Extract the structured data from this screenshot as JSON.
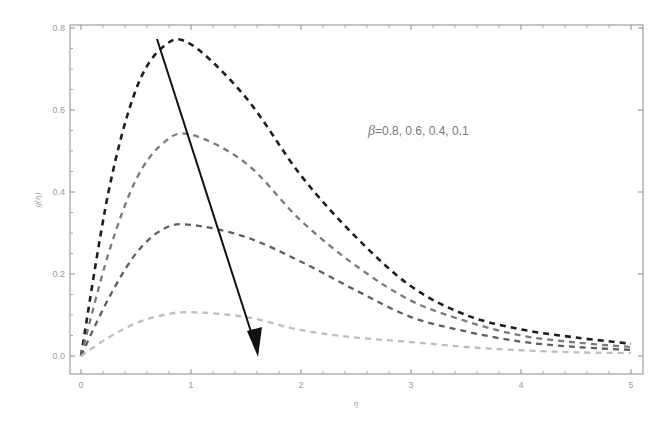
{
  "chart_data": {
    "type": "line",
    "title": "",
    "xlabel": "η",
    "ylabel": "g(η)",
    "xlim": [
      0,
      5
    ],
    "ylim": [
      0.0,
      0.8
    ],
    "xticks": [
      0,
      1,
      2,
      3,
      4,
      5
    ],
    "xtick_labels": [
      "0",
      "1",
      "2",
      "3",
      "4",
      "5"
    ],
    "yticks": [
      0.0,
      0.2,
      0.4,
      0.6,
      0.8
    ],
    "ytick_labels": [
      "0.0",
      "0.2",
      "0.4",
      "0.6",
      "0.8"
    ],
    "grid": false,
    "legend": null,
    "x": [
      0,
      0.25,
      0.5,
      0.75,
      1.0,
      1.5,
      2.0,
      2.5,
      3.0,
      3.5,
      4.0,
      4.5,
      5.0
    ],
    "series": [
      {
        "name": "β=0.8",
        "color": "#1e1e1e",
        "dash": "dashed",
        "values": [
          0,
          0.4,
          0.65,
          0.755,
          0.76,
          0.63,
          0.44,
          0.29,
          0.17,
          0.1,
          0.065,
          0.045,
          0.03
        ]
      },
      {
        "name": "β=0.6",
        "color": "#7a7a7a",
        "dash": "dashed",
        "values": [
          0,
          0.25,
          0.43,
          0.52,
          0.54,
          0.47,
          0.33,
          0.22,
          0.135,
          0.085,
          0.05,
          0.033,
          0.022
        ]
      },
      {
        "name": "β=0.4",
        "color": "#5e5e5e",
        "dash": "dashed",
        "values": [
          0,
          0.14,
          0.25,
          0.31,
          0.32,
          0.29,
          0.23,
          0.16,
          0.095,
          0.06,
          0.035,
          0.022,
          0.015
        ]
      },
      {
        "name": "β=0.1",
        "color": "#bdbdbd",
        "dash": "dashed",
        "values": [
          0,
          0.045,
          0.08,
          0.1,
          0.107,
          0.095,
          0.063,
          0.045,
          0.034,
          0.022,
          0.014,
          0.009,
          0.007
        ]
      }
    ],
    "annotations": [
      {
        "type": "text",
        "text_symbol": "β",
        "text_values": "=0.8, 0.6, 0.4, 0.1",
        "x": 3.15,
        "y": 0.54
      },
      {
        "type": "arrow",
        "from": [
          0.7,
          0.77
        ],
        "to": [
          1.61,
          0.0
        ],
        "meaning": "direction of decreasing β"
      }
    ]
  }
}
